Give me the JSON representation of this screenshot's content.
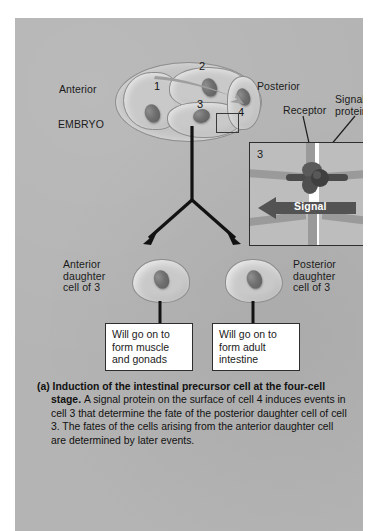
{
  "figure": {
    "panel_background": "#b4b4b4",
    "labels": {
      "anterior": "Anterior",
      "posterior": "Posterior",
      "embryo": "EMBRYO",
      "receptor": "Receptor",
      "signal_protein": "Signal\nprotein"
    },
    "embryo": {
      "cells": [
        {
          "number": "1"
        },
        {
          "number": "2"
        },
        {
          "number": "3"
        },
        {
          "number": "4"
        }
      ]
    },
    "inset": {
      "left_cell_number": "3",
      "right_cell_number": "4",
      "signal_arrow_label": "Signal"
    },
    "daughters": [
      {
        "label": "Anterior\ndaughter\ncell of 3",
        "outcome": "Will go on to\nform muscle\nand gonads"
      },
      {
        "label": "Posterior\ndaughter\ncell of 3",
        "outcome": "Will go on to\nform adult\nintestine"
      }
    ],
    "caption": {
      "part": "(a)",
      "title": "Induction of the intestinal precursor cell at the four-cell stage.",
      "body": "A signal protein on the surface of cell 4 induces events in cell 3 that determine the fate of the posterior daughter cell of cell 3. The fates of the cells arising from the anterior daughter cell are determined by later events."
    }
  }
}
